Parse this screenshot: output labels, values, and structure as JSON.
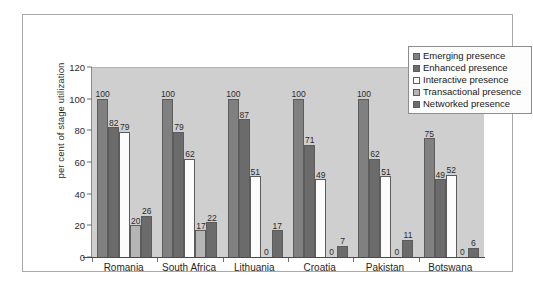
{
  "chart_data": {
    "type": "bar",
    "title": "",
    "xlabel": "",
    "ylabel": "per cent of stage utilization",
    "ylim": [
      0,
      120
    ],
    "yticks": [
      0,
      20,
      40,
      60,
      80,
      100,
      120
    ],
    "grid": false,
    "legend_position": "top-right",
    "categories": [
      "Romania",
      "South Africa",
      "Lithuania",
      "Croatia",
      "Pakistan",
      "Botswana"
    ],
    "series": [
      {
        "name": "Emerging presence",
        "color": "#808080",
        "values": [
          100,
          100,
          100,
          100,
          100,
          75
        ]
      },
      {
        "name": "Enhanced presence",
        "color": "#6b6b6b",
        "values": [
          82,
          79,
          87,
          71,
          62,
          49
        ]
      },
      {
        "name": "Interactive presence",
        "color": "#fcfcfc",
        "values": [
          79,
          62,
          51,
          49,
          51,
          52
        ]
      },
      {
        "name": "Transactional presence",
        "color": "#b5b5b5",
        "values": [
          20,
          17,
          0,
          0,
          0,
          0
        ]
      },
      {
        "name": "Networked presence",
        "color": "#6b6b6b",
        "values": [
          26,
          22,
          17,
          7,
          11,
          6
        ]
      }
    ]
  },
  "legend": {
    "items": [
      {
        "label": "Emerging presence"
      },
      {
        "label": "Enhanced presence"
      },
      {
        "label": "Interactive presence"
      },
      {
        "label": "Transactional presence"
      },
      {
        "label": "Networked presence"
      }
    ]
  },
  "axes": {
    "y_title": "per cent of stage utilization",
    "y_ticks": [
      "120",
      "100",
      "80",
      "60",
      "40",
      "20",
      "0"
    ]
  }
}
